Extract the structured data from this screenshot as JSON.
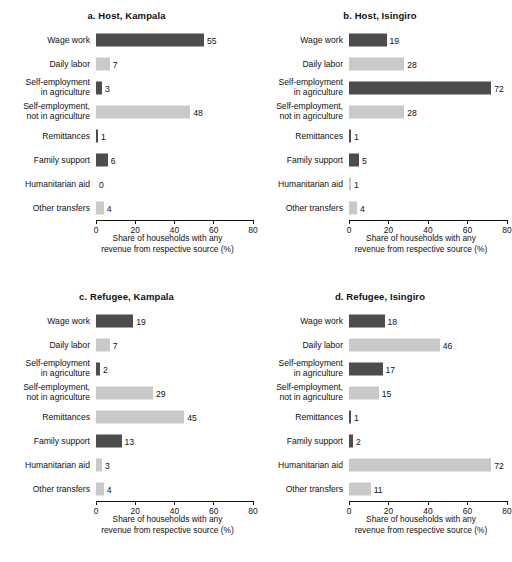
{
  "chart_data": [
    {
      "type": "bar",
      "title": "a. Host, Kampala",
      "orientation": "horizontal",
      "categories": [
        "Wage work",
        "Daily labor",
        "Self-employment in agriculture",
        "Self-employment, not in agriculture",
        "Remittances",
        "Family support",
        "Humanitarian aid",
        "Other transfers"
      ],
      "values": [
        55,
        7,
        3,
        48,
        1,
        6,
        0,
        4
      ],
      "xlabel": "Share of households with any revenue from respective source (%)",
      "ylabel": "",
      "xlim": [
        0,
        80
      ],
      "xticks": [
        0,
        20,
        40,
        60,
        80
      ],
      "grid": false,
      "legend": "none"
    },
    {
      "type": "bar",
      "title": "b. Host, Isingiro",
      "orientation": "horizontal",
      "categories": [
        "Wage work",
        "Daily labor",
        "Self-employment in agriculture",
        "Self-employment, not in agriculture",
        "Remittances",
        "Family support",
        "Humanitarian aid",
        "Other transfers"
      ],
      "values": [
        19,
        28,
        72,
        28,
        1,
        5,
        1,
        4
      ],
      "xlabel": "Share of households with any revenue from respective source (%)",
      "ylabel": "",
      "xlim": [
        0,
        80
      ],
      "xticks": [
        0,
        20,
        40,
        60,
        80
      ],
      "grid": false,
      "legend": "none"
    },
    {
      "type": "bar",
      "title": "c. Refugee, Kampala",
      "orientation": "horizontal",
      "categories": [
        "Wage work",
        "Daily labor",
        "Self-employment in agriculture",
        "Self-employment, not in agriculture",
        "Remittances",
        "Family support",
        "Humanitarian aid",
        "Other transfers"
      ],
      "values": [
        19,
        7,
        2,
        29,
        45,
        13,
        3,
        4
      ],
      "xlabel": "Share of households with any revenue from respective source (%)",
      "ylabel": "",
      "xlim": [
        0,
        80
      ],
      "xticks": [
        0,
        20,
        40,
        60,
        80
      ],
      "grid": false,
      "legend": "none"
    },
    {
      "type": "bar",
      "title": "d. Refugee, Isingiro",
      "orientation": "horizontal",
      "categories": [
        "Wage work",
        "Daily labor",
        "Self-employment in agriculture",
        "Self-employment, not in agriculture",
        "Remittances",
        "Family support",
        "Humanitarian aid",
        "Other transfers"
      ],
      "values": [
        18,
        46,
        17,
        15,
        1,
        2,
        72,
        11
      ],
      "xlabel": "Share of households with any revenue from respective source (%)",
      "ylabel": "",
      "xlim": [
        0,
        80
      ],
      "xticks": [
        0,
        20,
        40,
        60,
        80
      ],
      "grid": false,
      "legend": "none"
    }
  ],
  "panels": [
    {
      "key": "a",
      "title": "a. Host, Kampala",
      "axis_title_line1": "Share of households with any",
      "axis_title_line2": "revenue from respective source (%)",
      "ticks": [
        "0",
        "20",
        "40",
        "60",
        "80"
      ],
      "bars": [
        {
          "label": "Wage work",
          "value": 55,
          "value_text": "55",
          "color": "#4d4d4d"
        },
        {
          "label": "Daily labor",
          "value": 7,
          "value_text": "7",
          "color": "#c9c9c9"
        },
        {
          "label": "Self-employment in agriculture",
          "label_lines": [
            "Self-employment",
            "in agriculture"
          ],
          "value": 3,
          "value_text": "3",
          "color": "#4d4d4d"
        },
        {
          "label": "Self-employment, not in agriculture",
          "label_lines": [
            "Self-employment,",
            "not in agriculture"
          ],
          "value": 48,
          "value_text": "48",
          "color": "#c9c9c9"
        },
        {
          "label": "Remittances",
          "value": 1,
          "value_text": "1",
          "color": "#4d4d4d"
        },
        {
          "label": "Family support",
          "value": 6,
          "value_text": "6",
          "color": "#4d4d4d"
        },
        {
          "label": "Humanitarian aid",
          "value": 0,
          "value_text": "0",
          "color": "#c9c9c9"
        },
        {
          "label": "Other transfers",
          "value": 4,
          "value_text": "4",
          "color": "#c9c9c9"
        }
      ]
    },
    {
      "key": "b",
      "title": "b. Host, Isingiro",
      "axis_title_line1": "Share of households with any",
      "axis_title_line2": "revenue from respective source (%)",
      "ticks": [
        "0",
        "20",
        "40",
        "60",
        "80"
      ],
      "bars": [
        {
          "label": "Wage work",
          "value": 19,
          "value_text": "19",
          "color": "#4d4d4d"
        },
        {
          "label": "Daily labor",
          "value": 28,
          "value_text": "28",
          "color": "#c9c9c9"
        },
        {
          "label": "Self-employment in agriculture",
          "label_lines": [
            "Self-employment",
            "in agriculture"
          ],
          "value": 72,
          "value_text": "72",
          "color": "#4d4d4d"
        },
        {
          "label": "Self-employment, not in agriculture",
          "label_lines": [
            "Self-employment,",
            "not in agriculture"
          ],
          "value": 28,
          "value_text": "28",
          "color": "#c9c9c9"
        },
        {
          "label": "Remittances",
          "value": 1,
          "value_text": "1",
          "color": "#4d4d4d"
        },
        {
          "label": "Family support",
          "value": 5,
          "value_text": "5",
          "color": "#4d4d4d"
        },
        {
          "label": "Humanitarian aid",
          "value": 1,
          "value_text": "1",
          "color": "#c9c9c9"
        },
        {
          "label": "Other transfers",
          "value": 4,
          "value_text": "4",
          "color": "#c9c9c9"
        }
      ]
    },
    {
      "key": "c",
      "title": "c. Refugee, Kampala",
      "axis_title_line1": "Share of households with any",
      "axis_title_line2": "revenue from respective source (%)",
      "ticks": [
        "0",
        "20",
        "40",
        "60",
        "80"
      ],
      "bars": [
        {
          "label": "Wage work",
          "value": 19,
          "value_text": "19",
          "color": "#4d4d4d"
        },
        {
          "label": "Daily labor",
          "value": 7,
          "value_text": "7",
          "color": "#c9c9c9"
        },
        {
          "label": "Self-employment in agriculture",
          "label_lines": [
            "Self-employment",
            "in agriculture"
          ],
          "value": 2,
          "value_text": "2",
          "color": "#4d4d4d"
        },
        {
          "label": "Self-employment, not in agriculture",
          "label_lines": [
            "Self-employment,",
            "not in agriculture"
          ],
          "value": 29,
          "value_text": "29",
          "color": "#c9c9c9"
        },
        {
          "label": "Remittances",
          "value": 45,
          "value_text": "45",
          "color": "#c9c9c9"
        },
        {
          "label": "Family support",
          "value": 13,
          "value_text": "13",
          "color": "#4d4d4d"
        },
        {
          "label": "Humanitarian aid",
          "value": 3,
          "value_text": "3",
          "color": "#c9c9c9"
        },
        {
          "label": "Other transfers",
          "value": 4,
          "value_text": "4",
          "color": "#c9c9c9"
        }
      ]
    },
    {
      "key": "d",
      "title": "d. Refugee, Isingiro",
      "axis_title_line1": "Share of households with any",
      "axis_title_line2": "revenue from respective source (%)",
      "ticks": [
        "0",
        "20",
        "40",
        "60",
        "80"
      ],
      "bars": [
        {
          "label": "Wage work",
          "value": 18,
          "value_text": "18",
          "color": "#4d4d4d"
        },
        {
          "label": "Daily labor",
          "value": 46,
          "value_text": "46",
          "color": "#c9c9c9"
        },
        {
          "label": "Self-employment in agriculture",
          "label_lines": [
            "Self-employment",
            "in agriculture"
          ],
          "value": 17,
          "value_text": "17",
          "color": "#4d4d4d"
        },
        {
          "label": "Self-employment, not in agriculture",
          "label_lines": [
            "Self-employment,",
            "not in agriculture"
          ],
          "value": 15,
          "value_text": "15",
          "color": "#c9c9c9"
        },
        {
          "label": "Remittances",
          "value": 1,
          "value_text": "1",
          "color": "#4d4d4d"
        },
        {
          "label": "Family support",
          "value": 2,
          "value_text": "2",
          "color": "#4d4d4d"
        },
        {
          "label": "Humanitarian aid",
          "value": 72,
          "value_text": "72",
          "color": "#c9c9c9"
        },
        {
          "label": "Other transfers",
          "value": 11,
          "value_text": "11",
          "color": "#c9c9c9"
        }
      ]
    }
  ]
}
